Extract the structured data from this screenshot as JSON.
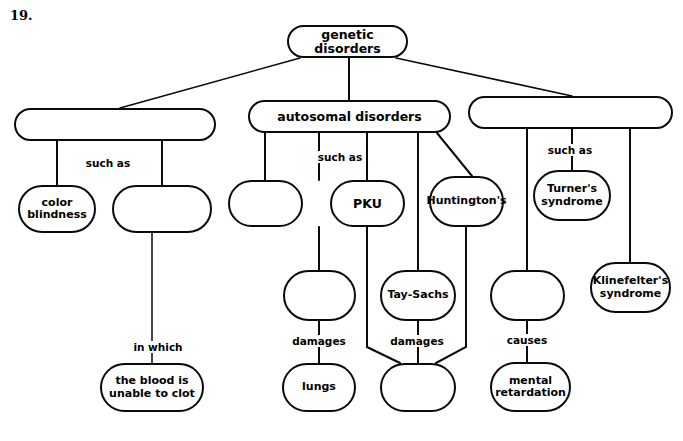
{
  "page": {
    "question_number": "19.",
    "background_color": "#ffffff",
    "ink_color": "#0a0a0a",
    "width": 683,
    "height": 441
  },
  "diagram": {
    "type": "concept-map",
    "title": "genetic disorders",
    "nodes": [
      {
        "id": "genetic-disorders",
        "label": "genetic disorders",
        "x": 287,
        "y": 25,
        "w": 121,
        "h": 33,
        "font": 12.5,
        "empty": false
      },
      {
        "id": "sex-linked-group",
        "label": "",
        "x": 14,
        "y": 108,
        "w": 202,
        "h": 33,
        "font": 12.5,
        "empty": true
      },
      {
        "id": "autosomal-disorders",
        "label": "autosomal disorders",
        "x": 248,
        "y": 100,
        "w": 203,
        "h": 33,
        "font": 12.5,
        "empty": false
      },
      {
        "id": "chromosomal-group",
        "label": "",
        "x": 468,
        "y": 96,
        "w": 205,
        "h": 33,
        "font": 12.5,
        "empty": true
      },
      {
        "id": "color-blindness",
        "label": "color\nblindness",
        "x": 18,
        "y": 185,
        "w": 78,
        "h": 48,
        "font": 11,
        "empty": false
      },
      {
        "id": "hemophilia-blank",
        "label": "",
        "x": 112,
        "y": 185,
        "w": 100,
        "h": 48,
        "font": 11,
        "empty": true
      },
      {
        "id": "cystic-fibrosis-blank",
        "label": "",
        "x": 228,
        "y": 180,
        "w": 75,
        "h": 47,
        "font": 11,
        "empty": true
      },
      {
        "id": "pku",
        "label": "PKU",
        "x": 330,
        "y": 180,
        "w": 75,
        "h": 47,
        "font": 12.5,
        "empty": false
      },
      {
        "id": "huntingtons",
        "label": "Huntington's",
        "x": 429,
        "y": 176,
        "w": 75,
        "h": 51,
        "font": 11,
        "empty": false
      },
      {
        "id": "turners-syndrome",
        "label": "Turner's\nsyndrome",
        "x": 533,
        "y": 170,
        "w": 78,
        "h": 51,
        "font": 11,
        "empty": false
      },
      {
        "id": "klinefelters-syndrome",
        "label": "Klinefelter's\nsyndrome",
        "x": 590,
        "y": 262,
        "w": 81,
        "h": 51,
        "font": 11,
        "empty": false
      },
      {
        "id": "mucus-blank",
        "label": "",
        "x": 283,
        "y": 270,
        "w": 73,
        "h": 51,
        "font": 11,
        "empty": true
      },
      {
        "id": "tay-sachs",
        "label": "Tay-Sachs",
        "x": 380,
        "y": 270,
        "w": 76,
        "h": 51,
        "font": 11,
        "empty": false
      },
      {
        "id": "nervous-system-blank",
        "label": "",
        "x": 490,
        "y": 270,
        "w": 75,
        "h": 51,
        "font": 11,
        "empty": true
      },
      {
        "id": "blood-clot",
        "label": "the blood is\nunable to clot",
        "x": 100,
        "y": 363,
        "w": 104,
        "h": 49,
        "font": 11,
        "empty": false
      },
      {
        "id": "lungs",
        "label": "lungs",
        "x": 282,
        "y": 363,
        "w": 74,
        "h": 49,
        "font": 11,
        "empty": false
      },
      {
        "id": "brain-blank",
        "label": "",
        "x": 380,
        "y": 363,
        "w": 76,
        "h": 49,
        "font": 11,
        "empty": true
      },
      {
        "id": "mental-retardation",
        "label": "mental\nretardation",
        "x": 490,
        "y": 362,
        "w": 81,
        "h": 50,
        "font": 11,
        "empty": false
      }
    ],
    "link_labels": [
      {
        "id": "such-as-left",
        "text": "such as",
        "x": 108,
        "y": 163
      },
      {
        "id": "such-as-middle",
        "text": "such as",
        "x": 340,
        "y": 157
      },
      {
        "id": "such-as-right",
        "text": "such as",
        "x": 570,
        "y": 150
      },
      {
        "id": "in-which",
        "text": "in which",
        "x": 158,
        "y": 347
      },
      {
        "id": "damages-lungs",
        "text": "damages",
        "x": 319,
        "y": 341
      },
      {
        "id": "damages-brain",
        "text": "damages",
        "x": 417,
        "y": 341
      },
      {
        "id": "causes",
        "text": "causes",
        "x": 527,
        "y": 340
      }
    ],
    "edges": [
      {
        "from": "genetic-disorders",
        "to": "sex-linked-group",
        "kind": "diagonal"
      },
      {
        "from": "genetic-disorders",
        "to": "autosomal-disorders",
        "kind": "vertical"
      },
      {
        "from": "genetic-disorders",
        "to": "chromosomal-group",
        "kind": "diagonal"
      },
      {
        "from": "sex-linked-group",
        "to": "color-blindness",
        "kind": "vertical"
      },
      {
        "from": "sex-linked-group",
        "to": "hemophilia-blank",
        "kind": "vertical"
      },
      {
        "from": "hemophilia-blank",
        "to": "blood-clot",
        "kind": "vertical"
      },
      {
        "from": "autosomal-disorders",
        "to": "cystic-fibrosis-blank",
        "kind": "vertical"
      },
      {
        "from": "autosomal-disorders",
        "to": "pku",
        "kind": "vertical"
      },
      {
        "from": "autosomal-disorders",
        "to": "tay-sachs",
        "kind": "vertical"
      },
      {
        "from": "autosomal-disorders",
        "to": "huntingtons",
        "kind": "diagonal"
      },
      {
        "from": "cystic-fibrosis-blank",
        "to": "mucus-blank",
        "kind": "vertical"
      },
      {
        "from": "mucus-blank",
        "to": "lungs",
        "kind": "vertical"
      },
      {
        "from": "pku",
        "to": "brain-blank",
        "kind": "bent"
      },
      {
        "from": "tay-sachs",
        "to": "brain-blank",
        "kind": "vertical"
      },
      {
        "from": "huntingtons",
        "to": "brain-blank",
        "kind": "bent"
      },
      {
        "from": "chromosomal-group",
        "to": "nervous-system-blank",
        "kind": "vertical"
      },
      {
        "from": "chromosomal-group",
        "to": "turners-syndrome",
        "kind": "vertical"
      },
      {
        "from": "chromosomal-group",
        "to": "klinefelters-syndrome",
        "kind": "vertical"
      },
      {
        "from": "nervous-system-blank",
        "to": "mental-retardation",
        "kind": "vertical"
      }
    ]
  }
}
